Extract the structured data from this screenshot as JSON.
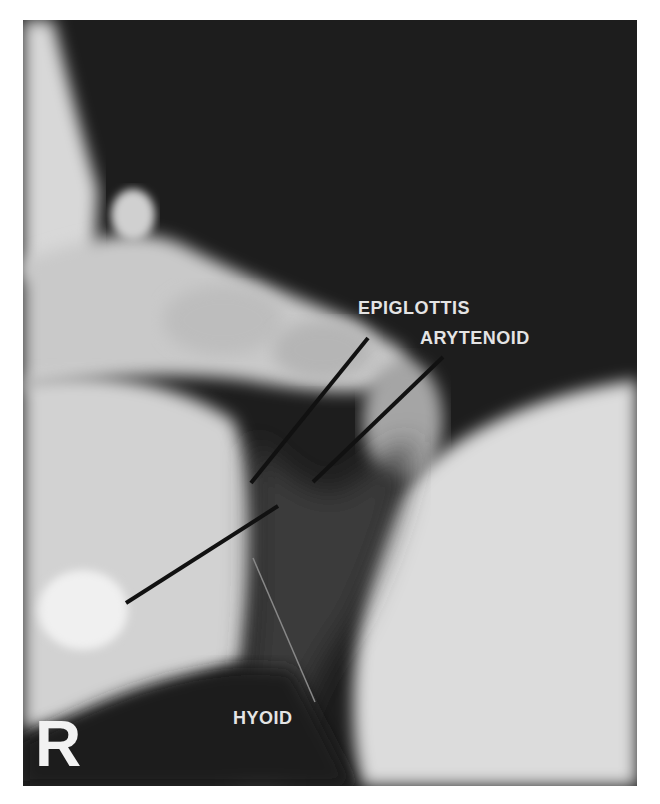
{
  "image": {
    "type": "lateral neck radiograph",
    "background_color": "#ffffff",
    "film_color": "#1c1c1c"
  },
  "labels": {
    "epiglottis": "EPIGLOTTIS",
    "arytenoid": "ARYTENOID",
    "hyoid": "HYOID"
  },
  "side_marker": "R"
}
